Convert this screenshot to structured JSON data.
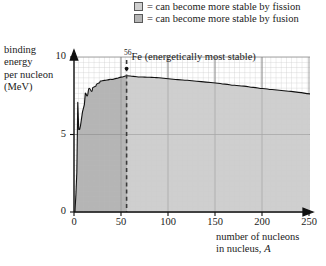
{
  "legend": {
    "items": [
      {
        "name": "fission",
        "label": "= can become more stable by fission",
        "color": "#cfcfcf"
      },
      {
        "name": "fusion",
        "label": "= can become more stable by fusion",
        "color": "#b5b5b5"
      }
    ]
  },
  "axes": {
    "ylabel_lines": [
      "binding",
      "energy",
      "per nucleon",
      "(MeV)"
    ],
    "xlabel_lines": [
      "number of nucleons",
      "in nucleus, "
    ],
    "xlabel_symbol": "A",
    "yticks": [
      "0",
      "5",
      "10"
    ],
    "xticks": [
      "0",
      "50",
      "100",
      "150",
      "200",
      "250"
    ]
  },
  "annotation": {
    "superscript": "56",
    "text": "Fe (energetically most stable)"
  },
  "chart_data": {
    "type": "line",
    "title": "",
    "xlabel": "number of nucleons in nucleus, A",
    "ylabel": "binding energy per nucleon (MeV)",
    "xlim": [
      0,
      250
    ],
    "ylim": [
      0,
      10
    ],
    "xticks": [
      0,
      50,
      100,
      150,
      200,
      250
    ],
    "yticks": [
      0,
      5,
      10
    ],
    "grid": true,
    "legend_position": "top-right",
    "fill": "area-under-curve",
    "regions": [
      {
        "name": "fusion",
        "x_range": [
          0,
          56
        ],
        "color": "#b5b5b5",
        "label": "can become more stable by fusion"
      },
      {
        "name": "fission",
        "x_range": [
          56,
          250
        ],
        "color": "#cfcfcf",
        "label": "can become more stable by fission"
      }
    ],
    "markers": [
      {
        "name": "Fe-56",
        "x": 56,
        "y": 8.8,
        "style": "dashed-vertical",
        "label": "56Fe (energetically most stable)"
      }
    ],
    "series": [
      {
        "name": "binding energy per nucleon",
        "x": [
          1,
          2,
          3,
          4,
          5,
          6,
          7,
          9,
          11,
          12,
          14,
          16,
          19,
          20,
          23,
          24,
          27,
          28,
          32,
          35,
          39,
          40,
          45,
          50,
          56,
          63,
          70,
          75,
          80,
          85,
          90,
          100,
          110,
          120,
          130,
          140,
          150,
          160,
          170,
          180,
          190,
          200,
          210,
          220,
          230,
          238,
          250
        ],
        "y": [
          0.0,
          1.11,
          2.57,
          7.07,
          5.33,
          5.33,
          5.61,
          6.46,
          6.93,
          7.68,
          7.48,
          7.98,
          7.78,
          8.03,
          8.11,
          8.26,
          8.33,
          8.45,
          8.49,
          8.52,
          8.56,
          8.55,
          8.62,
          8.7,
          8.79,
          8.75,
          8.71,
          8.7,
          8.69,
          8.68,
          8.66,
          8.6,
          8.54,
          8.5,
          8.44,
          8.38,
          8.32,
          8.25,
          8.18,
          8.12,
          8.04,
          7.97,
          7.9,
          7.84,
          7.78,
          7.72,
          7.62
        ]
      }
    ]
  }
}
